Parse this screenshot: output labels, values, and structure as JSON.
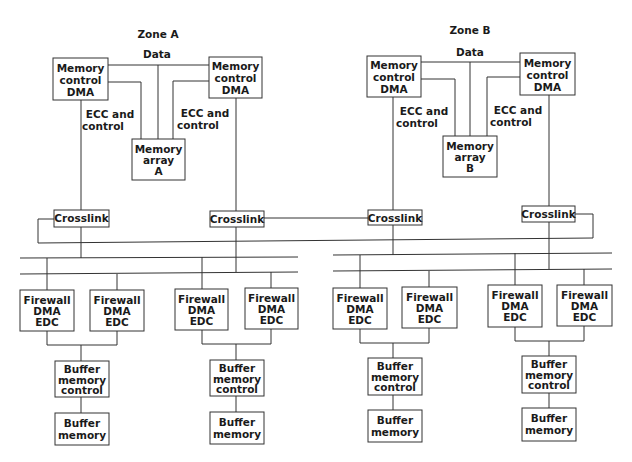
{
  "zones": [
    {
      "title": "Zone A",
      "data_label": "Data",
      "ecc_labels": [
        [
          "ECC and",
          "control"
        ],
        [
          "ECC and",
          "control"
        ]
      ],
      "memory_controllers": [
        [
          "Memory",
          "control",
          "DMA"
        ],
        [
          "Memory",
          "control",
          "DMA"
        ]
      ],
      "memory_array": [
        "Memory",
        "array",
        "A"
      ],
      "crosslinks": [
        "Crosslink",
        "Crosslink"
      ],
      "firewalls": [
        [
          "Firewall",
          "DMA",
          "EDC"
        ],
        [
          "Firewall",
          "DMA",
          "EDC"
        ],
        [
          "Firewall",
          "DMA",
          "EDC"
        ],
        [
          "Firewall",
          "DMA",
          "EDC"
        ]
      ],
      "buffer_controls": [
        [
          "Buffer",
          "memory",
          "control"
        ],
        [
          "Buffer",
          "memory",
          "control"
        ]
      ],
      "buffer_memories": [
        [
          "Buffer",
          "memory"
        ],
        [
          "Buffer",
          "memory"
        ]
      ]
    },
    {
      "title": "Zone B",
      "data_label": "Data",
      "ecc_labels": [
        [
          "ECC and",
          "control"
        ],
        [
          "ECC and",
          "control"
        ]
      ],
      "memory_controllers": [
        [
          "Memory",
          "control",
          "DMA"
        ],
        [
          "Memory",
          "control",
          "DMA"
        ]
      ],
      "memory_array": [
        "Memory",
        "array",
        "B"
      ],
      "crosslinks": [
        "Crosslink",
        "Crosslink"
      ],
      "firewalls": [
        [
          "Firewall",
          "DMA",
          "EDC"
        ],
        [
          "Firewall",
          "DMA",
          "EDC"
        ],
        [
          "Firewall",
          "DMA",
          "EDC"
        ],
        [
          "Firewall",
          "DMA",
          "EDC"
        ]
      ],
      "buffer_controls": [
        [
          "Buffer",
          "memory",
          "control"
        ],
        [
          "Buffer",
          "memory",
          "control"
        ]
      ],
      "buffer_memories": [
        [
          "Buffer",
          "memory"
        ],
        [
          "Buffer",
          "memory"
        ]
      ]
    }
  ]
}
